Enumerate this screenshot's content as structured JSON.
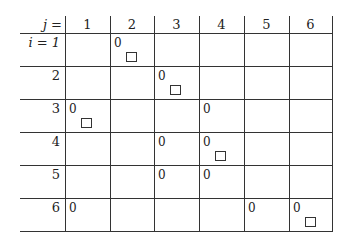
{
  "table": {
    "corner_label": "j =",
    "row_header_prefix": "i = 1",
    "columns": [
      "1",
      "2",
      "3",
      "4",
      "5",
      "6"
    ],
    "rows": [
      {
        "label": "i = 1",
        "cells": [
          "",
          "0□",
          "",
          "",
          "",
          ""
        ]
      },
      {
        "label": "2",
        "cells": [
          "",
          "",
          "0□",
          "",
          "",
          ""
        ]
      },
      {
        "label": "3",
        "cells": [
          "0□",
          "",
          "",
          "0",
          "",
          ""
        ]
      },
      {
        "label": "4",
        "cells": [
          "",
          "",
          "0",
          "0□",
          "",
          ""
        ]
      },
      {
        "label": "5",
        "cells": [
          "",
          "",
          "0",
          "0",
          "",
          ""
        ]
      },
      {
        "label": "6",
        "cells": [
          "0",
          "",
          "",
          "",
          "0",
          "0□"
        ]
      }
    ],
    "zero_symbol": "0"
  }
}
